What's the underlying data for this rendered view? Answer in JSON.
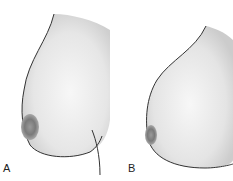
{
  "figure": {
    "panels": [
      {
        "label": "A",
        "description": "profile outline, narrower shape"
      },
      {
        "label": "B",
        "description": "profile outline, fuller rounded shape"
      }
    ]
  }
}
